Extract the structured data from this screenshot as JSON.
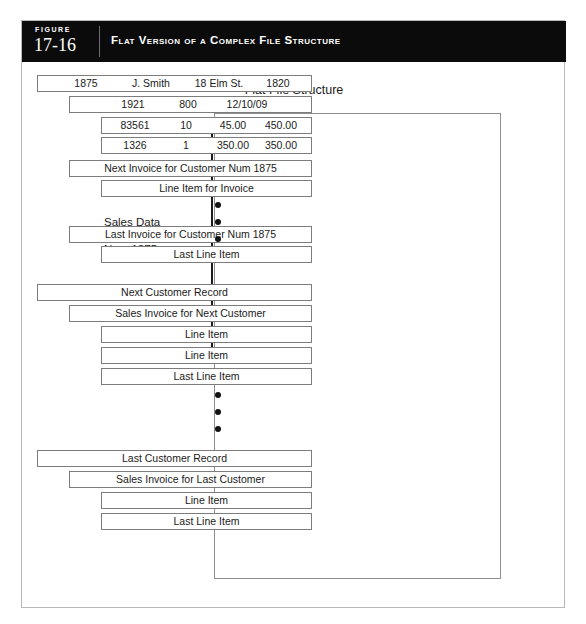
{
  "figure": {
    "label_word": "FIGURE",
    "number": "17-16",
    "title": "Flat Version of a Complex File Structure"
  },
  "diagram": {
    "title": "Flat File Structure",
    "annotation": {
      "line1": "Sales Data",
      "line2": "for Customer",
      "line3": "Num 1875"
    },
    "rows": [
      {
        "name": "customer-record-1875",
        "level": 0,
        "type": "fields",
        "cells": [
          {
            "text": "1875",
            "left": 18,
            "width": 60
          },
          {
            "text": "J. Smith",
            "left": 80,
            "width": 66
          },
          {
            "text": "18 Elm St.",
            "left": 146,
            "width": 70
          },
          {
            "text": "1820",
            "left": 214,
            "width": 52
          }
        ]
      },
      {
        "name": "invoice-record-1921",
        "level": 1,
        "type": "fields",
        "cells": [
          {
            "text": "1921",
            "left": 36,
            "width": 54
          },
          {
            "text": "800",
            "left": 96,
            "width": 44
          },
          {
            "text": "12/10/09",
            "left": 142,
            "width": 70
          }
        ]
      },
      {
        "name": "line-item-83561",
        "level": 2,
        "type": "fields",
        "cells": [
          {
            "text": "83561",
            "left": 6,
            "width": 54
          },
          {
            "text": "10",
            "left": 62,
            "width": 44
          },
          {
            "text": "45.00",
            "left": 104,
            "width": 54
          },
          {
            "text": "450.00",
            "left": 152,
            "width": 54
          }
        ]
      },
      {
        "name": "line-item-1326",
        "level": 2,
        "type": "fields",
        "cells": [
          {
            "text": "1326",
            "left": 6,
            "width": 54
          },
          {
            "text": "1",
            "left": 62,
            "width": 44
          },
          {
            "text": "350.00",
            "left": 104,
            "width": 54
          },
          {
            "text": "350.00",
            "left": 152,
            "width": 54
          }
        ]
      },
      {
        "name": "next-invoice-1875",
        "level": 1,
        "type": "label",
        "label": "Next Invoice for Customer Num 1875"
      },
      {
        "name": "line-item-for-invoice",
        "level": 2,
        "type": "label",
        "label": "Line Item for Invoice"
      },
      {
        "name": "last-invoice-1875",
        "level": 1,
        "type": "label",
        "label": "Last Invoice for Customer Num 1875"
      },
      {
        "name": "last-line-item-1875",
        "level": 2,
        "type": "label",
        "label": "Last Line Item"
      },
      {
        "name": "next-customer-record",
        "level": 0,
        "type": "label",
        "label": "Next Customer Record"
      },
      {
        "name": "sales-invoice-next-customer",
        "level": 1,
        "type": "label",
        "label": "Sales Invoice for Next Customer"
      },
      {
        "name": "line-item-next-1",
        "level": 2,
        "type": "label",
        "label": "Line Item"
      },
      {
        "name": "line-item-next-2",
        "level": 2,
        "type": "label",
        "label": "Line Item"
      },
      {
        "name": "last-line-item-next",
        "level": 2,
        "type": "label",
        "label": "Last Line Item"
      },
      {
        "name": "last-customer-record",
        "level": 0,
        "type": "label",
        "label": "Last Customer Record"
      },
      {
        "name": "sales-invoice-last-customer",
        "level": 1,
        "type": "label",
        "label": "Sales Invoice for Last Customer"
      },
      {
        "name": "line-item-last",
        "level": 2,
        "type": "label",
        "label": "Line Item"
      },
      {
        "name": "last-line-item-last",
        "level": 2,
        "type": "label",
        "label": "Last Line Item"
      }
    ],
    "row_tops": [
      13,
      34,
      55,
      75,
      98,
      118,
      164,
      184,
      222,
      243,
      264,
      285,
      306,
      388,
      409,
      430,
      451
    ],
    "ellipsis_groups": [
      {
        "name": "ellipsis-first-customer",
        "top": 140,
        "left": 190
      },
      {
        "name": "ellipsis-last-customer",
        "top": 330,
        "left": 190
      }
    ]
  }
}
